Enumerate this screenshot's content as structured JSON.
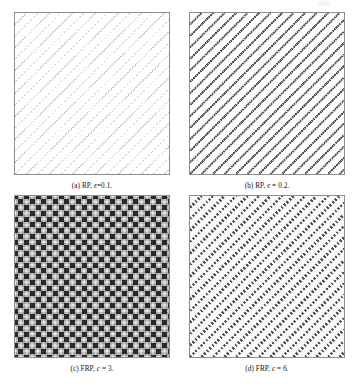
{
  "figure": {
    "panels": [
      {
        "id": "a",
        "label": "(a)",
        "caption_plain": "(a) RP, ϵ=0.1.",
        "caption_prefix": "(a) RP, ",
        "caption_symbol": "ϵ",
        "caption_suffix": "=0.1.",
        "method": "RP",
        "parameter_name": "epsilon",
        "parameter_value": "0.1",
        "pattern": "diagonal-lines-sparse-light",
        "line_color": "#b4b4b4",
        "background_color": "#ffffff",
        "border_color": "#8d8d8d"
      },
      {
        "id": "b",
        "label": "(b)",
        "caption_plain": "(b) RP, ϵ = 0.2.",
        "caption_prefix": "(b) RP, ",
        "caption_symbol": "ϵ",
        "caption_suffix": " = 0.2.",
        "method": "RP",
        "parameter_name": "epsilon",
        "parameter_value": "0.2",
        "pattern": "diagonal-lines-dark",
        "line_color": "#3a3a3a",
        "background_color": "#ffffff",
        "border_color": "#8d8d8d"
      },
      {
        "id": "c",
        "label": "(c)",
        "caption_plain": "(c) FRP, c = 3.",
        "caption_prefix": "(c) FRP, ",
        "caption_symbol": "c",
        "caption_suffix": " = 3.",
        "method": "FRP",
        "parameter_name": "c",
        "parameter_value": "3",
        "pattern": "checkerboard-lattice-blobs",
        "line_color": "#1c1c1c",
        "background_color": "#f2f2f2",
        "border_color": "#8d8d8d"
      },
      {
        "id": "d",
        "label": "(d)",
        "caption_plain": "(d) FRP, c = 6.",
        "caption_prefix": "(d) FRP, ",
        "caption_symbol": "c",
        "caption_suffix": " = 6.",
        "method": "FRP",
        "parameter_name": "c",
        "parameter_value": "6",
        "pattern": "diagonal-dotted-lines-fine",
        "line_color": "#2b2b2b",
        "background_color": "#fafafa",
        "border_color": "#8d8d8d"
      }
    ]
  },
  "chart_data": [
    {
      "type": "heatmap",
      "title": "(a) RP, ϵ=0.1.",
      "xlabel": "",
      "ylabel": "",
      "grid": false,
      "legend": "none",
      "description": "Recurrence plot with threshold epsilon = 0.1; sparse light-gray diagonal lines running lower-left to upper-right.",
      "parameter": {
        "name": "epsilon",
        "value": 0.1
      },
      "pattern": {
        "orientation": "anti-diagonal",
        "line_count": 19,
        "spacing_px": 11.5,
        "line_width_px": 1.0,
        "intensity": 0.28,
        "color": "#b4b4b4"
      },
      "xlim": [
        0,
        1
      ],
      "ylim": [
        0,
        1
      ]
    },
    {
      "type": "heatmap",
      "title": "(b) RP, ϵ = 0.2.",
      "xlabel": "",
      "ylabel": "",
      "grid": false,
      "legend": "none",
      "description": "Recurrence plot with threshold epsilon = 0.2; denser and darker diagonal lines than panel (a).",
      "parameter": {
        "name": "epsilon",
        "value": 0.2
      },
      "pattern": {
        "orientation": "anti-diagonal",
        "line_count": 19,
        "spacing_px": 11.5,
        "line_width_px": 2.0,
        "intensity": 0.8,
        "color": "#3a3a3a"
      },
      "xlim": [
        0,
        1
      ],
      "ylim": [
        0,
        1
      ]
    },
    {
      "type": "heatmap",
      "title": "(c) FRP, c = 3.",
      "xlabel": "",
      "ylabel": "",
      "grid": false,
      "legend": "none",
      "description": "Fuzzy recurrence plot with c = 3 clusters; dense checkerboard lattice of dark square blobs on light gray background.",
      "parameter": {
        "name": "c",
        "value": 3
      },
      "pattern": {
        "orientation": "lattice",
        "cell_size_px": 11.5,
        "blob_size_px": 5,
        "intensity": 0.92,
        "color": "#1c1c1c",
        "background": "#f2f2f2"
      },
      "xlim": [
        0,
        1
      ],
      "ylim": [
        0,
        1
      ]
    },
    {
      "type": "heatmap",
      "title": "(d) FRP, c = 6.",
      "xlabel": "",
      "ylabel": "",
      "grid": false,
      "legend": "none",
      "description": "Fuzzy recurrence plot with c = 6 clusters; fine dotted diagonal lines on near-white background.",
      "parameter": {
        "name": "c",
        "value": 6
      },
      "pattern": {
        "orientation": "anti-diagonal",
        "line_count": 19,
        "spacing_px": 11.5,
        "dot_size_px": 2.6,
        "intensity": 0.75,
        "color": "#2b2b2b",
        "background": "#fafafa"
      },
      "xlim": [
        0,
        1
      ],
      "ylim": [
        0,
        1
      ]
    }
  ]
}
